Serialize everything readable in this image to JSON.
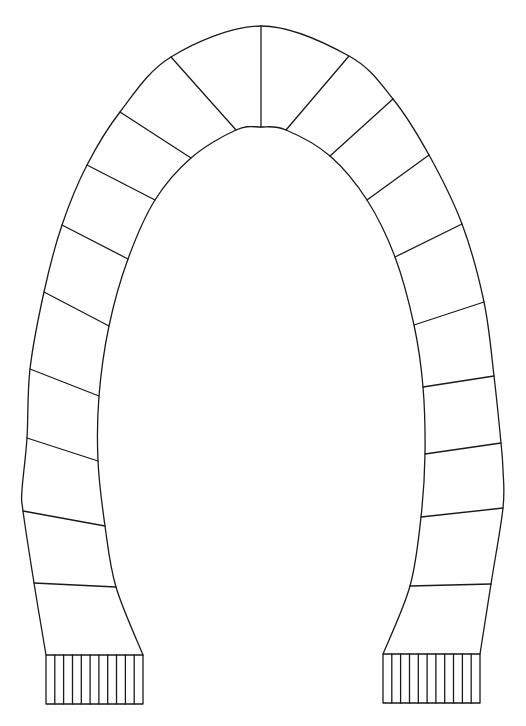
{
  "drawing": {
    "subject": "scarf-outline-coloring-page",
    "stroke_color": "#1a1a1a",
    "background": "#ffffff",
    "outer_edge": [
      [
        46,
        655
      ],
      [
        34,
        583
      ],
      [
        23,
        511
      ],
      [
        22,
        490
      ],
      [
        27,
        438
      ],
      [
        30,
        369
      ],
      [
        44,
        292
      ],
      [
        62,
        225
      ],
      [
        87,
        165
      ],
      [
        120,
        112
      ],
      [
        171,
        57
      ],
      [
        261,
        26
      ],
      [
        349,
        56
      ],
      [
        393,
        99
      ],
      [
        429,
        155
      ],
      [
        462,
        224
      ],
      [
        484,
        302
      ],
      [
        494,
        376
      ],
      [
        501,
        443
      ],
      [
        503,
        470
      ],
      [
        503,
        508
      ],
      [
        491,
        584
      ],
      [
        480,
        654
      ]
    ],
    "inner_edge": [
      [
        143,
        655
      ],
      [
        116,
        587
      ],
      [
        105,
        526
      ],
      [
        98,
        461
      ],
      [
        99,
        396
      ],
      [
        109,
        326
      ],
      [
        128,
        259
      ],
      [
        155,
        200
      ],
      [
        191,
        158
      ],
      [
        236,
        130
      ],
      [
        261,
        127
      ],
      [
        286,
        130
      ],
      [
        330,
        156
      ],
      [
        367,
        200
      ],
      [
        395,
        257
      ],
      [
        414,
        325
      ],
      [
        423,
        387
      ],
      [
        425,
        454
      ],
      [
        421,
        517
      ],
      [
        410,
        586
      ],
      [
        383,
        654
      ]
    ],
    "segment_lines": [
      [
        [
          34,
          583
        ],
        [
          116,
          587
        ]
      ],
      [
        [
          23,
          511
        ],
        [
          105,
          526
        ]
      ],
      [
        [
          27,
          438
        ],
        [
          98,
          461
        ]
      ],
      [
        [
          30,
          369
        ],
        [
          99,
          396
        ]
      ],
      [
        [
          44,
          292
        ],
        [
          109,
          326
        ]
      ],
      [
        [
          62,
          225
        ],
        [
          128,
          259
        ]
      ],
      [
        [
          87,
          165
        ],
        [
          155,
          200
        ]
      ],
      [
        [
          120,
          112
        ],
        [
          191,
          158
        ]
      ],
      [
        [
          171,
          57
        ],
        [
          236,
          130
        ]
      ],
      [
        [
          261,
          26
        ],
        [
          261,
          127
        ]
      ],
      [
        [
          349,
          56
        ],
        [
          286,
          130
        ]
      ],
      [
        [
          393,
          99
        ],
        [
          330,
          156
        ]
      ],
      [
        [
          429,
          155
        ],
        [
          367,
          200
        ]
      ],
      [
        [
          462,
          224
        ],
        [
          395,
          257
        ]
      ],
      [
        [
          484,
          302
        ],
        [
          414,
          325
        ]
      ],
      [
        [
          494,
          376
        ],
        [
          423,
          387
        ]
      ],
      [
        [
          501,
          443
        ],
        [
          425,
          454
        ]
      ],
      [
        [
          503,
          508
        ],
        [
          421,
          517
        ]
      ],
      [
        [
          491,
          584
        ],
        [
          410,
          586
        ]
      ]
    ],
    "fringe_left": {
      "x": 46,
      "y": 655,
      "width": 97,
      "height": 49,
      "strands": 11
    },
    "fringe_right": {
      "x": 383,
      "y": 654,
      "width": 97,
      "height": 49,
      "strands": 11
    }
  }
}
